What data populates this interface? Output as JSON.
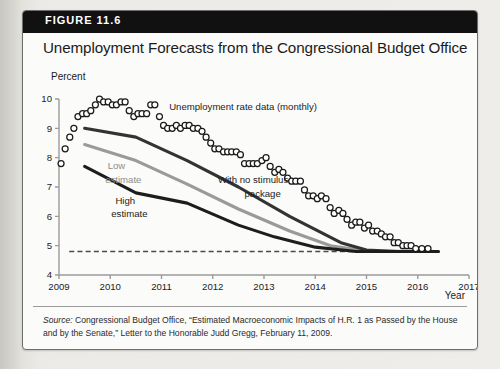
{
  "banner": {
    "label": "FIGURE 11.6"
  },
  "title": "Unemployment Forecasts from the Congressional Budget Office",
  "axis": {
    "y_unit": "Percent",
    "x_name": "Year"
  },
  "source": {
    "prefix": "Source:",
    "text": " Congressional Budget Office, “Estimated Macroeconomic Impacts of H.R. 1 as Passed by the House and by the Senate,” Letter to the Honorable Judd Gregg, February 11, 2009."
  },
  "annotations": {
    "scatter": "Unemployment rate data (monthly)",
    "low_line1": "Low",
    "low_line2": "estimate",
    "high_line1": "High",
    "high_line2": "estimate",
    "nostim_line1": "With no stimulus",
    "nostim_line2": "package"
  },
  "colors": {
    "banner": "#111111",
    "frame": "#fbfbfa",
    "high_estimate": "#1d1d1d",
    "low_estimate": "#9a9a9a",
    "no_stimulus": "#333333",
    "scatter_stroke": "#1b1b1b",
    "natural_rate_dash": "#4a4a4a",
    "axis": "#9b9b9b"
  },
  "chart_data": {
    "type": "scatter",
    "title": "Unemployment Forecasts from the Congressional Budget Office",
    "xlabel": "Year",
    "ylabel": "Percent",
    "xlim": [
      2009,
      2017
    ],
    "ylim": [
      4,
      10
    ],
    "xticks": [
      "2009",
      "2010",
      "2011",
      "2012",
      "2013",
      "2014",
      "2015",
      "2016",
      "2017"
    ],
    "yticks": [
      "4",
      "5",
      "6",
      "7",
      "8",
      "9",
      "10"
    ],
    "grid": false,
    "legend": "none",
    "series": [
      {
        "name": "Unemployment rate data (monthly)",
        "type": "scatter",
        "marker": "open-circle",
        "points": [
          [
            2009.04,
            7.8
          ],
          [
            2009.12,
            8.3
          ],
          [
            2009.21,
            8.7
          ],
          [
            2009.29,
            9.0
          ],
          [
            2009.37,
            9.4
          ],
          [
            2009.46,
            9.5
          ],
          [
            2009.54,
            9.5
          ],
          [
            2009.62,
            9.6
          ],
          [
            2009.71,
            9.8
          ],
          [
            2009.79,
            10.0
          ],
          [
            2009.87,
            9.9
          ],
          [
            2009.96,
            9.9
          ],
          [
            2010.04,
            9.8
          ],
          [
            2010.12,
            9.8
          ],
          [
            2010.21,
            9.9
          ],
          [
            2010.29,
            9.9
          ],
          [
            2010.37,
            9.6
          ],
          [
            2010.46,
            9.4
          ],
          [
            2010.54,
            9.5
          ],
          [
            2010.62,
            9.5
          ],
          [
            2010.71,
            9.5
          ],
          [
            2010.79,
            9.8
          ],
          [
            2010.87,
            9.8
          ],
          [
            2010.96,
            9.4
          ],
          [
            2011.04,
            9.1
          ],
          [
            2011.12,
            9.0
          ],
          [
            2011.21,
            9.0
          ],
          [
            2011.29,
            9.1
          ],
          [
            2011.37,
            9.0
          ],
          [
            2011.46,
            9.1
          ],
          [
            2011.54,
            9.1
          ],
          [
            2011.62,
            9.0
          ],
          [
            2011.71,
            9.0
          ],
          [
            2011.79,
            8.9
          ],
          [
            2011.87,
            8.7
          ],
          [
            2011.96,
            8.5
          ],
          [
            2012.04,
            8.3
          ],
          [
            2012.12,
            8.3
          ],
          [
            2012.21,
            8.2
          ],
          [
            2012.29,
            8.2
          ],
          [
            2012.37,
            8.2
          ],
          [
            2012.46,
            8.2
          ],
          [
            2012.54,
            8.1
          ],
          [
            2012.62,
            7.8
          ],
          [
            2012.71,
            7.8
          ],
          [
            2012.79,
            7.8
          ],
          [
            2012.87,
            7.8
          ],
          [
            2012.96,
            7.9
          ],
          [
            2013.04,
            8.0
          ],
          [
            2013.12,
            7.7
          ],
          [
            2013.21,
            7.5
          ],
          [
            2013.29,
            7.6
          ],
          [
            2013.37,
            7.5
          ],
          [
            2013.46,
            7.3
          ],
          [
            2013.54,
            7.2
          ],
          [
            2013.62,
            7.2
          ],
          [
            2013.71,
            7.2
          ],
          [
            2013.79,
            6.9
          ],
          [
            2013.87,
            6.7
          ],
          [
            2013.96,
            6.7
          ],
          [
            2014.04,
            6.6
          ],
          [
            2014.12,
            6.7
          ],
          [
            2014.21,
            6.6
          ],
          [
            2014.29,
            6.3
          ],
          [
            2014.37,
            6.1
          ],
          [
            2014.46,
            6.2
          ],
          [
            2014.54,
            6.1
          ],
          [
            2014.62,
            5.9
          ],
          [
            2014.71,
            5.7
          ],
          [
            2014.79,
            5.8
          ],
          [
            2014.87,
            5.8
          ],
          [
            2014.96,
            5.6
          ],
          [
            2015.04,
            5.7
          ],
          [
            2015.12,
            5.5
          ],
          [
            2015.21,
            5.5
          ],
          [
            2015.29,
            5.4
          ],
          [
            2015.37,
            5.3
          ],
          [
            2015.46,
            5.3
          ],
          [
            2015.54,
            5.1
          ],
          [
            2015.62,
            5.1
          ],
          [
            2015.71,
            5.0
          ],
          [
            2015.79,
            5.0
          ],
          [
            2015.87,
            5.0
          ],
          [
            2015.96,
            4.9
          ],
          [
            2016.08,
            4.9
          ],
          [
            2016.2,
            4.9
          ]
        ]
      },
      {
        "name": "With no stimulus package",
        "type": "line",
        "color": "#333333",
        "points": [
          [
            2009.5,
            9.0
          ],
          [
            2010.5,
            8.7
          ],
          [
            2011.5,
            7.9
          ],
          [
            2012.5,
            7.0
          ],
          [
            2013.5,
            6.0
          ],
          [
            2014.5,
            5.1
          ],
          [
            2015.0,
            4.85
          ],
          [
            2015.6,
            4.8
          ],
          [
            2016.4,
            4.8
          ]
        ]
      },
      {
        "name": "High estimate",
        "type": "line",
        "color": "#1d1d1d",
        "points": [
          [
            2009.5,
            7.7
          ],
          [
            2010.5,
            6.8
          ],
          [
            2011.5,
            6.45
          ],
          [
            2012.5,
            5.7
          ],
          [
            2013.2,
            5.3
          ],
          [
            2014.0,
            4.95
          ],
          [
            2014.8,
            4.8
          ],
          [
            2016.4,
            4.8
          ]
        ]
      },
      {
        "name": "Low estimate",
        "type": "line",
        "color": "#9a9a9a",
        "points": [
          [
            2009.5,
            8.45
          ],
          [
            2010.5,
            7.9
          ],
          [
            2011.5,
            7.1
          ],
          [
            2012.5,
            6.25
          ],
          [
            2013.5,
            5.5
          ],
          [
            2014.3,
            5.0
          ],
          [
            2015.0,
            4.82
          ],
          [
            2016.4,
            4.8
          ]
        ]
      },
      {
        "name": "Natural rate (dashed)",
        "type": "line-dashed",
        "color": "#4a4a4a",
        "points": [
          [
            2009.2,
            4.8
          ],
          [
            2016.4,
            4.8
          ]
        ]
      }
    ]
  }
}
